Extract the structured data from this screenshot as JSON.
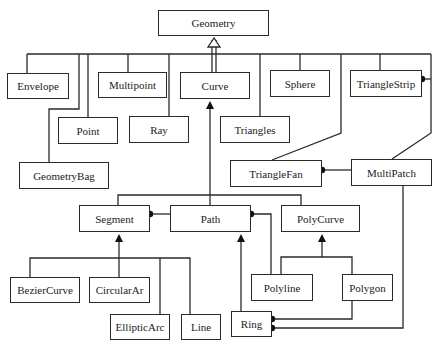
{
  "diagram": {
    "type": "uml-class-diagram",
    "colors": {
      "line": "#2a2a2a",
      "box_fill": "#ffffff",
      "text": "#222222"
    },
    "classes": {
      "geometry": "Geometry",
      "envelope": "Envelope",
      "multipoint": "Multipoint",
      "curve": "Curve",
      "sphere": "Sphere",
      "triangle_strip": "TriangleStrip",
      "point": "Point",
      "ray": "Ray",
      "triangles": "Triangles",
      "geometry_bag": "GeometryBag",
      "triangle_fan": "TriangleFan",
      "multi_patch": "MultiPatch",
      "segment": "Segment",
      "path": "Path",
      "poly_curve": "PolyCurve",
      "bezier_curve": "BezierCurve",
      "circular_arc": "CircularAr",
      "elliptic_arc": "EllipticArc",
      "line": "Line",
      "ring": "Ring",
      "polyline": "Polyline",
      "polygon": "Polygon"
    },
    "relationships": [
      {
        "from": "Envelope",
        "to": "Geometry",
        "kind": "inheritance"
      },
      {
        "from": "Multipoint",
        "to": "Geometry",
        "kind": "inheritance"
      },
      {
        "from": "Curve",
        "to": "Geometry",
        "kind": "inheritance"
      },
      {
        "from": "Sphere",
        "to": "Geometry",
        "kind": "inheritance"
      },
      {
        "from": "TriangleStrip",
        "to": "Geometry",
        "kind": "inheritance"
      },
      {
        "from": "Point",
        "to": "Geometry",
        "kind": "inheritance"
      },
      {
        "from": "Ray",
        "to": "Geometry",
        "kind": "inheritance"
      },
      {
        "from": "Triangles",
        "to": "Geometry",
        "kind": "inheritance"
      },
      {
        "from": "GeometryBag",
        "to": "Geometry",
        "kind": "inheritance"
      },
      {
        "from": "TriangleFan",
        "to": "Geometry",
        "kind": "inheritance"
      },
      {
        "from": "MultiPatch",
        "to": "Geometry",
        "kind": "inheritance"
      },
      {
        "from": "Segment",
        "to": "Curve",
        "kind": "inheritance"
      },
      {
        "from": "Path",
        "to": "Curve",
        "kind": "inheritance"
      },
      {
        "from": "PolyCurve",
        "to": "Curve",
        "kind": "inheritance"
      },
      {
        "from": "BezierCurve",
        "to": "Segment",
        "kind": "inheritance"
      },
      {
        "from": "CircularAr",
        "to": "Segment",
        "kind": "inheritance"
      },
      {
        "from": "EllipticArc",
        "to": "Segment",
        "kind": "inheritance"
      },
      {
        "from": "Line",
        "to": "Segment",
        "kind": "inheritance"
      },
      {
        "from": "Ring",
        "to": "Path",
        "kind": "inheritance"
      },
      {
        "from": "Polyline",
        "to": "PolyCurve",
        "kind": "inheritance"
      },
      {
        "from": "Polygon",
        "to": "PolyCurve",
        "kind": "inheritance"
      },
      {
        "from": "Path",
        "to": "Segment",
        "kind": "composition"
      },
      {
        "from": "Path",
        "to": "Ring",
        "kind": "composition"
      },
      {
        "from": "Polygon",
        "to": "Ring",
        "kind": "composition"
      },
      {
        "from": "MultiPatch",
        "to": "TriangleFan",
        "kind": "composition"
      },
      {
        "from": "MultiPatch",
        "to": "TriangleStrip",
        "kind": "composition"
      },
      {
        "from": "MultiPatch",
        "to": "Ring",
        "kind": "composition"
      }
    ]
  }
}
